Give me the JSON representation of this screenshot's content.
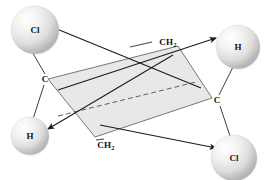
{
  "figure": {
    "background_color": "#ffffff",
    "line_color": "#1a1a1a",
    "plane_fill": "#e8e8e6",
    "plane_stroke": "#555555",
    "sphere_light": "#fdfdfd",
    "sphere_mid": "#e6e6e6",
    "sphere_dark": "#bcbcbc"
  },
  "spheres": [
    {
      "id": "cl-top-left",
      "label": "Cl",
      "cx": 35,
      "cy": 30,
      "r": 24
    },
    {
      "id": "h-top-right",
      "label": "H",
      "cx": 238,
      "cy": 47,
      "r": 22
    },
    {
      "id": "h-bottom-left",
      "label": "H",
      "cx": 30,
      "cy": 136,
      "r": 19
    },
    {
      "id": "cl-bottom-right",
      "label": "Cl",
      "cx": 234,
      "cy": 158,
      "r": 23
    }
  ],
  "atoms": [
    {
      "id": "carbon-left",
      "label": "C",
      "x": 45,
      "y": 79
    },
    {
      "id": "carbon-right",
      "label": "C",
      "x": 217,
      "y": 100
    }
  ],
  "group_labels": [
    {
      "id": "ch2-top",
      "text": "CH",
      "sub": "2",
      "x": 168,
      "y": 42
    },
    {
      "id": "ch2-bottom",
      "text": "CH",
      "sub": "2",
      "x": 106,
      "y": 145
    }
  ],
  "plane": {
    "id": "cyclopropane-plane",
    "points": "48,79 178,46 212,98 95,137"
  },
  "bonds": [
    {
      "id": "bond-c-left-to-cl",
      "x1": 45,
      "y1": 74,
      "x2": 31,
      "y2": 50
    },
    {
      "id": "bond-c-left-to-h",
      "x1": 44,
      "y1": 85,
      "x2": 33,
      "y2": 119
    },
    {
      "id": "bond-c-right-to-h",
      "x1": 219,
      "y1": 95,
      "x2": 233,
      "y2": 67
    },
    {
      "id": "bond-c-right-to-cl",
      "x1": 220,
      "y1": 106,
      "x2": 230,
      "y2": 136
    }
  ],
  "arrows": [
    {
      "id": "arrow-to-cl-top-left",
      "x1": 201,
      "y1": 88,
      "x2": 52,
      "y2": 27
    },
    {
      "id": "arrow-to-h-top-right",
      "x1": 58,
      "y1": 90,
      "x2": 216,
      "y2": 38
    },
    {
      "id": "arrow-to-h-bottom-left",
      "x1": 173,
      "y1": 55,
      "x2": 48,
      "y2": 129
    },
    {
      "id": "arrow-to-cl-bottom-right",
      "x1": 100,
      "y1": 125,
      "x2": 216,
      "y2": 148
    }
  ],
  "connectors": [
    {
      "id": "connector-ch2-top",
      "x1": 152,
      "y1": 42,
      "x2": 130,
      "y2": 47
    },
    {
      "id": "connector-ch2-bottom",
      "x1": 96,
      "y1": 140,
      "x2": 104,
      "y2": 139
    }
  ],
  "dashed_diagonal": {
    "id": "plane-diagonal-dashed",
    "x1": 58,
    "y1": 116,
    "x2": 196,
    "y2": 82
  }
}
